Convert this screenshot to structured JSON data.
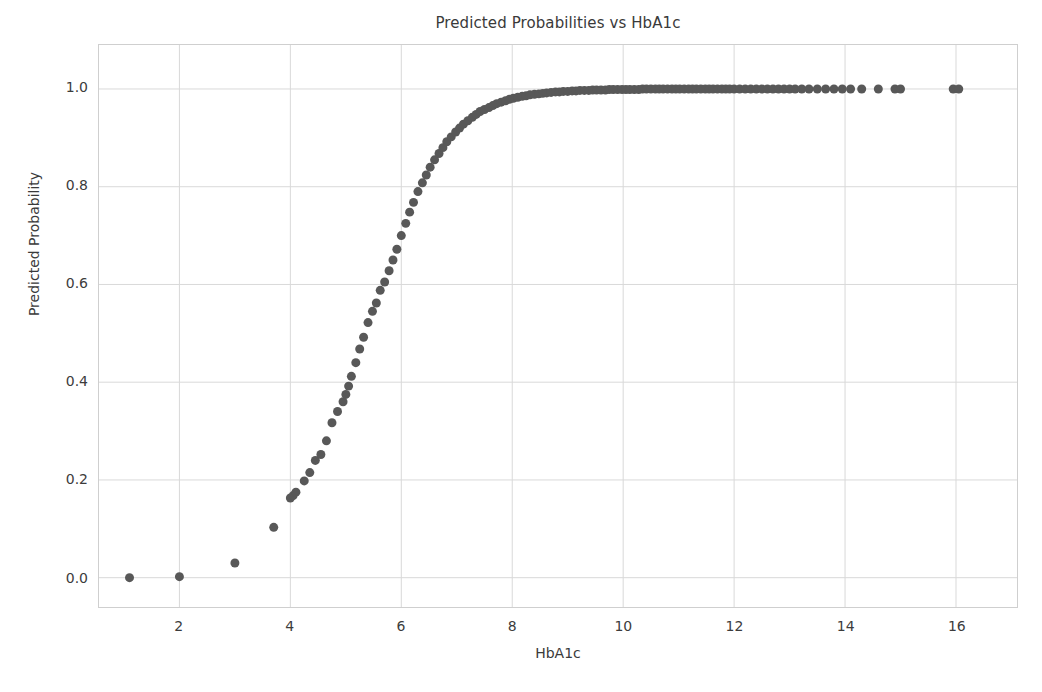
{
  "chart_data": {
    "type": "scatter",
    "title": "Predicted Probabilities vs HbA1c",
    "xlabel": "HbA1c",
    "ylabel": "Predicted Probability",
    "xlim": [
      0.55,
      17.1
    ],
    "ylim": [
      -0.06,
      1.09
    ],
    "xticks": [
      2,
      4,
      6,
      8,
      10,
      12,
      14,
      16
    ],
    "xticklabels": [
      "2",
      "4",
      "6",
      "8",
      "10",
      "12",
      "14",
      "16"
    ],
    "yticks": [
      0.0,
      0.2,
      0.4,
      0.6,
      0.8,
      1.0
    ],
    "yticklabels": [
      "0.0",
      "0.2",
      "0.4",
      "0.6",
      "0.8",
      "1.0"
    ],
    "grid": true,
    "grid_color": "#d9d9d9",
    "marker": "circle",
    "marker_color": "#585858",
    "marker_size": 9,
    "legend": null,
    "series": [
      {
        "name": "Predicted Probability",
        "x": [
          1.1,
          2.0,
          3.0,
          3.7,
          4.0,
          4.05,
          4.1,
          4.25,
          4.35,
          4.45,
          4.55,
          4.65,
          4.75,
          4.85,
          4.95,
          5.0,
          5.05,
          5.1,
          5.18,
          5.25,
          5.32,
          5.4,
          5.48,
          5.55,
          5.62,
          5.7,
          5.78,
          5.85,
          5.92,
          6.0,
          6.08,
          6.15,
          6.22,
          6.3,
          6.38,
          6.45,
          6.52,
          6.6,
          6.68,
          6.75,
          6.82,
          6.9,
          6.98,
          7.05,
          7.12,
          7.2,
          7.28,
          7.35,
          7.42,
          7.5,
          7.58,
          7.65,
          7.72,
          7.8,
          7.88,
          7.95,
          8.02,
          8.1,
          8.18,
          8.25,
          8.32,
          8.4,
          8.48,
          8.55,
          8.62,
          8.7,
          8.78,
          8.85,
          8.92,
          9.0,
          9.08,
          9.15,
          9.22,
          9.3,
          9.38,
          9.45,
          9.52,
          9.6,
          9.68,
          9.75,
          9.82,
          9.9,
          9.98,
          10.05,
          10.12,
          10.2,
          10.28,
          10.35,
          10.42,
          10.5,
          10.58,
          10.65,
          10.72,
          10.8,
          10.88,
          10.95,
          11.02,
          11.1,
          11.18,
          11.25,
          11.32,
          11.4,
          11.48,
          11.55,
          11.62,
          11.7,
          11.78,
          11.85,
          11.92,
          12.0,
          12.1,
          12.2,
          12.3,
          12.4,
          12.5,
          12.6,
          12.7,
          12.8,
          12.9,
          13.0,
          13.1,
          13.22,
          13.35,
          13.5,
          13.65,
          13.8,
          13.95,
          14.1,
          14.3,
          14.6,
          14.9,
          15.0,
          15.95,
          16.05
        ],
        "y": [
          0.0,
          0.002,
          0.03,
          0.103,
          0.163,
          0.168,
          0.175,
          0.198,
          0.215,
          0.24,
          0.252,
          0.28,
          0.317,
          0.34,
          0.36,
          0.375,
          0.392,
          0.412,
          0.44,
          0.468,
          0.492,
          0.522,
          0.545,
          0.562,
          0.588,
          0.605,
          0.628,
          0.65,
          0.672,
          0.7,
          0.725,
          0.748,
          0.768,
          0.79,
          0.808,
          0.824,
          0.84,
          0.855,
          0.868,
          0.88,
          0.892,
          0.902,
          0.912,
          0.92,
          0.928,
          0.935,
          0.942,
          0.948,
          0.954,
          0.958,
          0.962,
          0.966,
          0.97,
          0.973,
          0.976,
          0.979,
          0.981,
          0.983,
          0.985,
          0.986,
          0.988,
          0.989,
          0.99,
          0.991,
          0.992,
          0.993,
          0.994,
          0.994,
          0.995,
          0.995,
          0.996,
          0.996,
          0.997,
          0.997,
          0.997,
          0.998,
          0.998,
          0.998,
          0.998,
          0.999,
          0.999,
          0.999,
          0.999,
          0.999,
          0.999,
          0.999,
          0.999,
          1.0,
          1.0,
          1.0,
          1.0,
          1.0,
          1.0,
          1.0,
          1.0,
          1.0,
          1.0,
          1.0,
          1.0,
          1.0,
          1.0,
          1.0,
          1.0,
          1.0,
          1.0,
          1.0,
          1.0,
          1.0,
          1.0,
          1.0,
          1.0,
          1.0,
          1.0,
          1.0,
          1.0,
          1.0,
          1.0,
          1.0,
          1.0,
          1.0,
          1.0,
          1.0,
          1.0,
          1.0,
          1.0,
          1.0,
          1.0,
          1.0,
          1.0,
          1.0,
          1.0,
          1.0,
          1.0,
          1.0
        ]
      }
    ]
  }
}
